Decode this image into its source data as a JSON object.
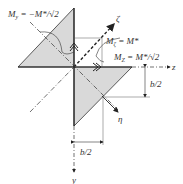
{
  "diagram": {
    "labels": {
      "m_y": "M",
      "m_y_sub": "y",
      "m_y_eq": " = −M*/√2",
      "m_zeta": "M",
      "m_zeta_sub": "ζ",
      "m_zeta_eq": " = M*",
      "m_z": "M",
      "m_z_sub": "Z",
      "m_z_eq": " = M*/√2",
      "axis_z": "z",
      "axis_y": "y",
      "axis_zeta": "ζ",
      "axis_eta": "η",
      "dim_vertical": "b/2",
      "dim_horizontal": "b/2"
    },
    "colors": {
      "fill": "#d9d9d9",
      "stroke": "#222222"
    }
  }
}
